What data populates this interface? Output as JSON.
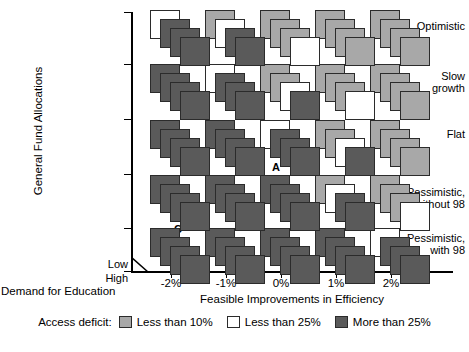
{
  "axes": {
    "y_title": "General Fund Allocations",
    "x_title": "Feasible Improvements in Efficiency",
    "depth_title": "Demand for Education",
    "depth_low": "Low",
    "depth_high": "High"
  },
  "legend": {
    "title": "Access deficit:",
    "items": [
      {
        "label": "Less than 10%",
        "color": "#a8a8a8",
        "key": "gray"
      },
      {
        "label": "Less than 25%",
        "color": "#ffffff",
        "key": "white"
      },
      {
        "label": "More than 25%",
        "color": "#5a5a5a",
        "key": "dark"
      }
    ]
  },
  "chart_data": {
    "type": "heatmap",
    "title": "",
    "xlabel": "Feasible Improvements in Efficiency",
    "ylabel": "General Fund Allocations",
    "zlabel": "Demand for Education",
    "grid": false,
    "legend_position": "bottom",
    "categories": [
      "-2%",
      "-1%",
      "0%",
      "1%",
      "2%"
    ],
    "rows": [
      "Optimistic",
      "Slow growth",
      "Flat",
      "Pessimistic, without 98",
      "Pessimistic, with 98"
    ],
    "depth_levels": [
      "Low",
      "High"
    ],
    "value_legend": {
      "gray": "Less than 10%",
      "white": "Less than 25%",
      "dark": "More than 25%"
    },
    "cells": [
      {
        "row": 0,
        "col": 0,
        "stack": [
          "white",
          "dark",
          "dark",
          "dark"
        ],
        "tag": ""
      },
      {
        "row": 0,
        "col": 1,
        "stack": [
          "gray",
          "white",
          "dark",
          "dark"
        ],
        "tag": ""
      },
      {
        "row": 0,
        "col": 2,
        "stack": [
          "gray",
          "gray",
          "gray",
          "white"
        ],
        "tag": ""
      },
      {
        "row": 0,
        "col": 3,
        "stack": [
          "gray",
          "gray",
          "gray",
          "gray"
        ],
        "tag": ""
      },
      {
        "row": 0,
        "col": 4,
        "stack": [
          "gray",
          "gray",
          "gray",
          "gray"
        ],
        "tag": ""
      },
      {
        "row": 1,
        "col": 0,
        "stack": [
          "dark",
          "dark",
          "dark",
          "dark"
        ],
        "tag": ""
      },
      {
        "row": 1,
        "col": 1,
        "stack": [
          "white",
          "dark",
          "dark",
          "dark"
        ],
        "tag": ""
      },
      {
        "row": 1,
        "col": 2,
        "stack": [
          "gray",
          "gray",
          "white",
          "dark"
        ],
        "tag": ""
      },
      {
        "row": 1,
        "col": 3,
        "stack": [
          "gray",
          "gray",
          "gray",
          "white"
        ],
        "tag": ""
      },
      {
        "row": 1,
        "col": 4,
        "stack": [
          "gray",
          "gray",
          "gray",
          "gray"
        ],
        "tag": ""
      },
      {
        "row": 2,
        "col": 0,
        "stack": [
          "dark",
          "dark",
          "dark",
          "dark"
        ],
        "tag": ""
      },
      {
        "row": 2,
        "col": 1,
        "stack": [
          "dark",
          "dark",
          "dark",
          "dark"
        ],
        "tag": ""
      },
      {
        "row": 2,
        "col": 2,
        "stack": [
          "white",
          "dark",
          "dark",
          "dark"
        ],
        "tag": "A"
      },
      {
        "row": 2,
        "col": 3,
        "stack": [
          "gray",
          "gray",
          "white",
          "dark"
        ],
        "tag": ""
      },
      {
        "row": 2,
        "col": 4,
        "stack": [
          "gray",
          "gray",
          "gray",
          "gray"
        ],
        "tag": ""
      },
      {
        "row": 3,
        "col": 0,
        "stack": [
          "dark",
          "dark",
          "dark",
          "dark"
        ],
        "tag": ""
      },
      {
        "row": 3,
        "col": 1,
        "stack": [
          "dark",
          "dark",
          "dark",
          "dark"
        ],
        "tag": "B"
      },
      {
        "row": 3,
        "col": 2,
        "stack": [
          "dark",
          "dark",
          "dark",
          "dark"
        ],
        "tag": ""
      },
      {
        "row": 3,
        "col": 3,
        "stack": [
          "gray",
          "white",
          "dark",
          "dark"
        ],
        "tag": ""
      },
      {
        "row": 3,
        "col": 4,
        "stack": [
          "gray",
          "gray",
          "gray",
          "white"
        ],
        "tag": ""
      },
      {
        "row": 4,
        "col": 0,
        "stack": [
          "dark",
          "dark",
          "dark",
          "dark"
        ],
        "tag": "C"
      },
      {
        "row": 4,
        "col": 1,
        "stack": [
          "dark",
          "dark",
          "dark",
          "dark"
        ],
        "tag": ""
      },
      {
        "row": 4,
        "col": 2,
        "stack": [
          "dark",
          "dark",
          "dark",
          "dark"
        ],
        "tag": ""
      },
      {
        "row": 4,
        "col": 3,
        "stack": [
          "dark",
          "dark",
          "dark",
          "dark"
        ],
        "tag": ""
      },
      {
        "row": 4,
        "col": 4,
        "stack": [
          "white",
          "dark",
          "dark",
          "dark"
        ],
        "tag": ""
      }
    ]
  }
}
